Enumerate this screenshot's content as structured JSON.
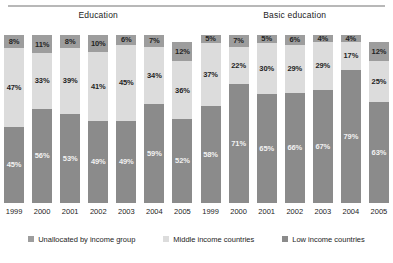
{
  "colors": {
    "unallocated": "#9d9d9d",
    "middle": "#dcdcdc",
    "low": "#8b8b8b",
    "rule": "#b8b8b8",
    "background": "#ffffff"
  },
  "legend": {
    "items": [
      {
        "label": "Unallocated by income group",
        "color": "#9d9d9d",
        "key": "unallocated"
      },
      {
        "label": "Middle income countries",
        "color": "#dcdcdc",
        "key": "middle"
      },
      {
        "label": "Low income countries",
        "color": "#8b8b8b",
        "key": "low"
      }
    ]
  },
  "chart_data": [
    {
      "type": "bar",
      "stacked": true,
      "normalized": true,
      "title": "Education",
      "xlabel": "",
      "ylabel": "",
      "ylim": [
        0,
        100
      ],
      "grid": false,
      "legend_position": "bottom",
      "categories": [
        "1999",
        "2000",
        "2001",
        "2002",
        "2003",
        "2004",
        "2005"
      ],
      "series": [
        {
          "name": "Unallocated by income group",
          "values": [
            8,
            11,
            8,
            10,
            6,
            7,
            12
          ]
        },
        {
          "name": "Middle income countries",
          "values": [
            47,
            33,
            39,
            41,
            45,
            34,
            36
          ]
        },
        {
          "name": "Low income countries",
          "values": [
            45,
            56,
            53,
            49,
            49,
            59,
            52
          ]
        }
      ],
      "labels": {
        "unallocated": [
          "8%",
          "11%",
          "8%",
          "10%",
          "6%",
          "7%",
          "12%"
        ],
        "middle": [
          "47%",
          "33%",
          "39%",
          "41%",
          "45%",
          "34%",
          "36%"
        ],
        "low": [
          "45%",
          "56%",
          "53%",
          "49%",
          "49%",
          "59%",
          "52%"
        ]
      }
    },
    {
      "type": "bar",
      "stacked": true,
      "normalized": true,
      "title": "Basic education",
      "xlabel": "",
      "ylabel": "",
      "ylim": [
        0,
        100
      ],
      "grid": false,
      "legend_position": "bottom",
      "categories": [
        "1999",
        "2000",
        "2001",
        "2002",
        "2003",
        "2004",
        "2005"
      ],
      "series": [
        {
          "name": "Unallocated by income group",
          "values": [
            5,
            7,
            5,
            6,
            4,
            4,
            12
          ]
        },
        {
          "name": "Middle income countries",
          "values": [
            37,
            22,
            30,
            29,
            29,
            17,
            25
          ]
        },
        {
          "name": "Low income countries",
          "values": [
            58,
            71,
            65,
            66,
            67,
            79,
            63
          ]
        }
      ],
      "labels": {
        "unallocated": [
          "5%",
          "7%",
          "5%",
          "6%",
          "4%",
          "4%",
          "12%"
        ],
        "middle": [
          "37%",
          "22%",
          "30%",
          "29%",
          "29%",
          "17%",
          "25%"
        ],
        "low": [
          "58%",
          "71%",
          "65%",
          "66%",
          "67%",
          "79%",
          "63%"
        ]
      }
    }
  ]
}
